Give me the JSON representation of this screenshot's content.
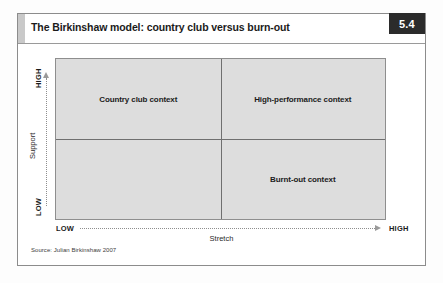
{
  "figure": {
    "number": "5.4",
    "title": "The Birkinshaw model: country club versus burn-out",
    "source": "Source: Julian Birkinshaw 2007"
  },
  "chart_data": {
    "type": "matrix",
    "title": "The Birkinshaw model: country club versus burn-out",
    "xlabel": "Stretch",
    "ylabel": "Support",
    "x_ticks": [
      "LOW",
      "HIGH"
    ],
    "y_ticks": [
      "LOW",
      "HIGH"
    ],
    "grid": true,
    "legend": "none",
    "quadrants": [
      {
        "position": "top-left",
        "x": "low",
        "y": "high",
        "label": "Country club context"
      },
      {
        "position": "top-right",
        "x": "high",
        "y": "high",
        "label": "High-performance context"
      },
      {
        "position": "bottom-left",
        "x": "low",
        "y": "low",
        "label": ""
      },
      {
        "position": "bottom-right",
        "x": "high",
        "y": "low",
        "label": "Burnt-out context"
      }
    ],
    "colors": {
      "plot_fill": "#dddddd",
      "plot_border": "#8e8e8e",
      "divider": "#6f6f6f",
      "badge_bg": "#2b2b2b",
      "badge_text": "#ffffff",
      "tab": "#c9c9c9"
    }
  },
  "axes": {
    "y": {
      "high": "HIGH",
      "low": "LOW",
      "title": "Support"
    },
    "x": {
      "low": "LOW",
      "high": "HIGH",
      "title": "Stretch"
    }
  }
}
